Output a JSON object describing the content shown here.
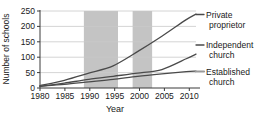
{
  "chart_data": {
    "type": "line",
    "title": "",
    "xlabel": "Year",
    "ylabel": "Number of schools",
    "xlim": [
      1980,
      2012
    ],
    "ylim": [
      0,
      250
    ],
    "grid": true,
    "legend_position": "right-inline",
    "xticks": [
      "1980",
      "1985",
      "1990",
      "1995",
      "2000",
      "2005",
      "2010"
    ],
    "xtick_values": [
      1980,
      1985,
      1990,
      1995,
      2000,
      2005,
      2010
    ],
    "yticks": [
      "0",
      "50",
      "100",
      "150",
      "200",
      "250"
    ],
    "ytick_values": [
      0,
      50,
      100,
      150,
      200,
      250
    ],
    "x": [
      1980,
      1985,
      1990,
      1995,
      2000,
      2005,
      2010,
      2012
    ],
    "series": [
      {
        "name": "Private proprietor",
        "label_line1": "Private",
        "label_line2": "proprietor",
        "color": "#4a4a4a",
        "values": [
          8,
          25,
          48,
          72,
          118,
          168,
          222,
          240
        ]
      },
      {
        "name": "Independent church",
        "label_line1": "Independent",
        "label_line2": "church",
        "color": "#4a4a4a",
        "values": [
          5,
          16,
          28,
          38,
          48,
          60,
          95,
          110
        ]
      },
      {
        "name": "Established church",
        "label_line1": "Established",
        "label_line2": "church",
        "color": "#9a9a9a",
        "values": [
          6,
          12,
          20,
          28,
          38,
          46,
          53,
          55
        ]
      }
    ],
    "shaded_bands": [
      {
        "name": "band-1",
        "start": 1989,
        "end": 1996,
        "color": "#c4c4c4"
      },
      {
        "name": "band-2",
        "start": 1999,
        "end": 2003,
        "color": "#c4c4c4"
      }
    ]
  }
}
